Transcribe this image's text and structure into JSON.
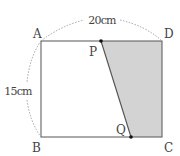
{
  "diagram": {
    "type": "geometry",
    "shape": "rectangle",
    "vertices": {
      "A": {
        "label": "A",
        "x": 41,
        "y": 41
      },
      "B": {
        "label": "B",
        "x": 41,
        "y": 137
      },
      "C": {
        "label": "C",
        "x": 162,
        "y": 137
      },
      "D": {
        "label": "D",
        "x": 162,
        "y": 41
      }
    },
    "points": {
      "P": {
        "label": "P",
        "x": 101,
        "y": 41,
        "on_side": "AD"
      },
      "Q": {
        "label": "Q",
        "x": 131,
        "y": 137,
        "on_side": "BC"
      }
    },
    "dimensions": {
      "top": {
        "label": "20cm",
        "between": [
          "A",
          "D"
        ]
      },
      "left": {
        "label": "15cm",
        "between": [
          "A",
          "B"
        ]
      }
    },
    "shaded_region": {
      "polygon": [
        "P",
        "D",
        "C",
        "Q"
      ],
      "fill": "#d3d3d3"
    },
    "colors": {
      "line": "#555555",
      "dashed_arc": "#999999",
      "shade": "#d3d3d3",
      "point": "#111111"
    }
  }
}
